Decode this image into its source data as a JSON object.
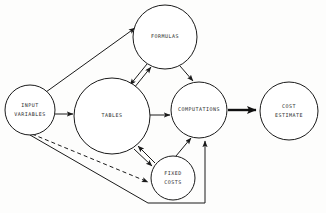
{
  "diagram": {
    "background_color": "#fdfdfc",
    "line_color": "#1a1a1a",
    "node_fill": "#ffffff",
    "text_color": "#2b2b2b",
    "nodes": [
      {
        "id": "input-variables",
        "label_line_1": "INPUT",
        "label_line_2": "VARIABLES",
        "cx": 30,
        "cy": 110,
        "r": 25
      },
      {
        "id": "tables",
        "label_line_1": "TABLES",
        "label_line_2": "",
        "cx": 112,
        "cy": 116,
        "r": 38
      },
      {
        "id": "formulas",
        "label_line_1": "FORMULAS",
        "label_line_2": "",
        "cx": 165,
        "cy": 37,
        "r": 32
      },
      {
        "id": "computations",
        "label_line_1": "COMPUTATIONS",
        "label_line_2": "",
        "cx": 199,
        "cy": 110,
        "r": 28
      },
      {
        "id": "cost-estimate",
        "label_line_1": "COST",
        "label_line_2": "ESTIMATE",
        "cx": 289,
        "cy": 111,
        "r": 29
      },
      {
        "id": "fixed-costs",
        "label_line_1": "FIXED",
        "label_line_2": "COSTS",
        "cx": 173,
        "cy": 178,
        "r": 22
      }
    ],
    "edges": [
      {
        "id": "input-variables-to-formulas",
        "from": "input-variables",
        "to": "formulas",
        "style": "solid",
        "weight": "normal",
        "direction": "one-way"
      },
      {
        "id": "input-variables-to-tables",
        "from": "input-variables",
        "to": "tables",
        "style": "solid",
        "weight": "normal",
        "direction": "one-way"
      },
      {
        "id": "input-variables-to-fixed-costs",
        "from": "input-variables",
        "to": "fixed-costs",
        "style": "dashed",
        "weight": "normal",
        "direction": "one-way"
      },
      {
        "id": "input-variables-to-computations",
        "from": "input-variables",
        "to": "computations",
        "style": "solid",
        "weight": "normal",
        "direction": "one-way"
      },
      {
        "id": "tables-to-formulas",
        "from": "tables",
        "to": "formulas",
        "style": "solid",
        "weight": "normal",
        "direction": "two-way"
      },
      {
        "id": "tables-to-computations",
        "from": "tables",
        "to": "computations",
        "style": "solid",
        "weight": "normal",
        "direction": "one-way"
      },
      {
        "id": "tables-to-fixed-costs",
        "from": "tables",
        "to": "fixed-costs",
        "style": "solid",
        "weight": "normal",
        "direction": "two-way"
      },
      {
        "id": "formulas-to-computations",
        "from": "formulas",
        "to": "computations",
        "style": "solid",
        "weight": "normal",
        "direction": "one-way"
      },
      {
        "id": "fixed-costs-to-computations",
        "from": "fixed-costs",
        "to": "computations",
        "style": "solid",
        "weight": "normal",
        "direction": "one-way"
      },
      {
        "id": "computations-to-cost-estimate",
        "from": "computations",
        "to": "cost-estimate",
        "style": "solid",
        "weight": "thick",
        "direction": "one-way"
      }
    ]
  }
}
